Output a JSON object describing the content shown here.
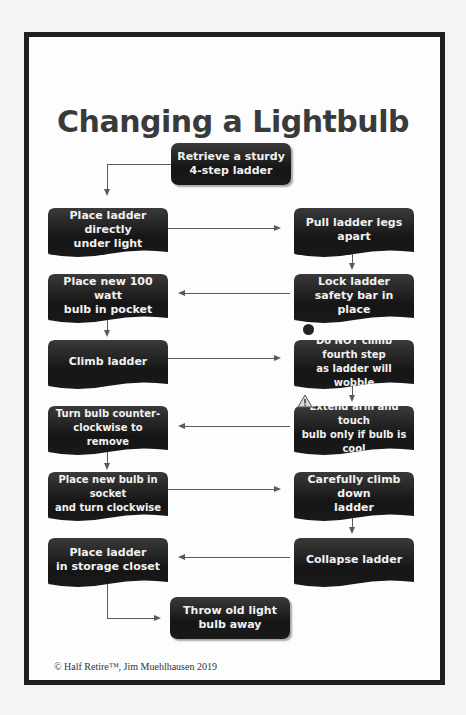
{
  "title": "Changing a Lightbulb",
  "steps": [
    {
      "id": "retrieve",
      "text": "Retrieve a sturdy\n4-step ladder"
    },
    {
      "id": "place-under",
      "text": "Place ladder directly\nunder light"
    },
    {
      "id": "pull-legs",
      "text": "Pull ladder legs\napart"
    },
    {
      "id": "lock-bar",
      "text": "Lock ladder\nsafety bar in place"
    },
    {
      "id": "bulb-pocket",
      "text": "Place new 100 watt\nbulb in pocket"
    },
    {
      "id": "climb",
      "text": "Climb ladder"
    },
    {
      "id": "do-not-climb",
      "text": "Do NOT climb fourth step\nas ladder will wobble"
    },
    {
      "id": "extend-arm",
      "text": "Extend arm and touch\nbulb only if bulb is cool"
    },
    {
      "id": "turn-counter",
      "text": "Turn bulb counter-\nclockwise to remove"
    },
    {
      "id": "place-socket",
      "text": "Place new bulb in socket\nand turn clockwise"
    },
    {
      "id": "climb-down",
      "text": "Carefully climb down\nladder"
    },
    {
      "id": "collapse",
      "text": "Collapse ladder"
    },
    {
      "id": "storage",
      "text": "Place ladder\nin storage closet"
    },
    {
      "id": "throw-away",
      "text": "Throw old light\nbulb away"
    }
  ],
  "icons": {
    "stop": "stop-circle-icon",
    "warning": "warning-triangle-icon"
  },
  "footer": {
    "copyright": "© Half Retire™, Jim Muehlhausen 2019"
  }
}
